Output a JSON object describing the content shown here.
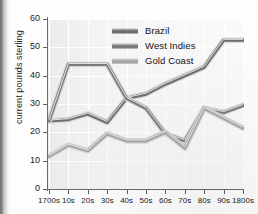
{
  "chart_data": {
    "type": "line",
    "title": "",
    "xlabel": "",
    "ylabel": "current pounds sterling",
    "categories": [
      "1700s",
      "10s",
      "20s",
      "30s",
      "40s",
      "50s",
      "60s",
      "70s",
      "80s",
      "90s",
      "1800s"
    ],
    "ylim": [
      0,
      60
    ],
    "yticks": [
      0,
      10,
      20,
      30,
      40,
      50,
      60
    ],
    "grid": true,
    "legend_position": "top-center",
    "series": [
      {
        "name": "Brazil",
        "color": "#6e6e6e",
        "values": [
          24.0,
          24.5,
          26.5,
          23.5,
          32.0,
          33.5,
          37.0,
          40.0,
          43.0,
          52.5,
          52.5
        ]
      },
      {
        "name": "West Indies",
        "color": "#7a7a7a",
        "values": [
          24.0,
          44.0,
          44.0,
          44.0,
          32.0,
          28.5,
          19.5,
          17.0,
          28.5,
          27.0,
          29.5
        ]
      },
      {
        "name": "Gold Coast",
        "color": "#a6a6a6",
        "values": [
          11.5,
          15.5,
          13.5,
          19.5,
          17.0,
          17.0,
          20.0,
          14.5,
          28.5,
          25.0,
          21.5
        ]
      }
    ]
  },
  "legend": {
    "items": [
      {
        "label": "Brazil"
      },
      {
        "label": "West Indies"
      },
      {
        "label": "Gold Coast"
      }
    ]
  }
}
